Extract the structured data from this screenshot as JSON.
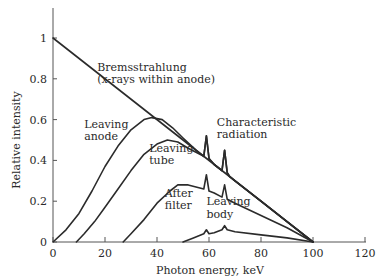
{
  "chart_data": {
    "type": "line",
    "title": "",
    "xlabel": "Photon energy, keV",
    "ylabel": "Relative intensity",
    "xlim": [
      0,
      120
    ],
    "ylim": [
      0,
      1.1
    ],
    "x_ticks": [
      0,
      20,
      40,
      60,
      80,
      100,
      120
    ],
    "y_ticks": [
      0,
      0.2,
      0.4,
      0.6,
      0.8,
      1
    ],
    "y_tick_labels": [
      "0",
      "0.2",
      "0.4",
      "0.6",
      "0.8",
      "1"
    ],
    "x_tick_labels": [
      "0",
      "20",
      "40",
      "60",
      "80",
      "100",
      "120"
    ],
    "grid": false,
    "legend": null,
    "series": [
      {
        "name": "Bremsstrahlung (x-rays within anode)",
        "x": [
          0,
          100
        ],
        "y": [
          1.0,
          0.0
        ]
      },
      {
        "name": "Leaving anode",
        "x": [
          0,
          5,
          10,
          15,
          20,
          25,
          30,
          35,
          38,
          42,
          46,
          50,
          55,
          58,
          59,
          60,
          62,
          65,
          66,
          67,
          68,
          70,
          80,
          90,
          100
        ],
        "y": [
          0,
          0.06,
          0.14,
          0.25,
          0.37,
          0.47,
          0.55,
          0.6,
          0.61,
          0.6,
          0.56,
          0.51,
          0.45,
          0.42,
          0.52,
          0.41,
          0.38,
          0.35,
          0.45,
          0.34,
          0.32,
          0.3,
          0.2,
          0.1,
          0
        ]
      },
      {
        "name": "Leaving tube",
        "x": [
          9,
          12,
          16,
          20,
          25,
          30,
          35,
          40,
          44,
          48,
          52,
          55,
          58,
          59,
          60,
          62,
          65,
          66,
          67,
          68,
          70,
          80,
          90,
          100
        ],
        "y": [
          0,
          0.04,
          0.1,
          0.17,
          0.26,
          0.35,
          0.43,
          0.48,
          0.5,
          0.49,
          0.46,
          0.44,
          0.42,
          0.52,
          0.41,
          0.38,
          0.35,
          0.45,
          0.34,
          0.32,
          0.3,
          0.2,
          0.1,
          0
        ]
      },
      {
        "name": "After filter",
        "x": [
          27,
          30,
          35,
          40,
          45,
          48,
          52,
          55,
          58,
          59,
          60,
          62,
          65,
          66,
          67,
          70,
          80,
          90,
          100
        ],
        "y": [
          0,
          0.04,
          0.11,
          0.19,
          0.25,
          0.28,
          0.28,
          0.27,
          0.26,
          0.33,
          0.25,
          0.24,
          0.22,
          0.28,
          0.21,
          0.19,
          0.13,
          0.07,
          0
        ]
      },
      {
        "name": "Leaving body",
        "x": [
          50,
          54,
          58,
          59,
          60,
          62,
          65,
          66,
          67,
          70,
          80,
          90,
          100
        ],
        "y": [
          0,
          0.02,
          0.04,
          0.06,
          0.04,
          0.045,
          0.06,
          0.08,
          0.06,
          0.05,
          0.035,
          0.02,
          0
        ]
      }
    ],
    "annotations": [
      {
        "text": "Bremsstrahlung",
        "x": 17,
        "y": 0.84
      },
      {
        "text": "(x-rays within anode)",
        "x": 17,
        "y": 0.78
      },
      {
        "text": "Leaving",
        "x": 12,
        "y": 0.56
      },
      {
        "text": "anode",
        "x": 12,
        "y": 0.5
      },
      {
        "text": "Leaving",
        "x": 37,
        "y": 0.44
      },
      {
        "text": "tube",
        "x": 37,
        "y": 0.38
      },
      {
        "text": "After",
        "x": 43,
        "y": 0.22
      },
      {
        "text": "filter",
        "x": 43,
        "y": 0.16
      },
      {
        "text": "Leaving",
        "x": 59,
        "y": 0.18
      },
      {
        "text": "body",
        "x": 59,
        "y": 0.12
      },
      {
        "text": "Characteristic",
        "x": 63,
        "y": 0.57
      },
      {
        "text": "radiation",
        "x": 63,
        "y": 0.51
      }
    ]
  }
}
